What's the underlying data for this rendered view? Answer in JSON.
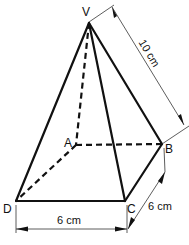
{
  "figure": {
    "type": "square-based pyramid",
    "vertices": {
      "V": {
        "label": "V",
        "x": 89,
        "y": 23
      },
      "A": {
        "label": "A",
        "x": 76,
        "y": 145
      },
      "B": {
        "label": "B",
        "x": 162,
        "y": 144
      },
      "C": {
        "label": "C",
        "x": 125,
        "y": 201
      },
      "D": {
        "label": "D",
        "x": 16,
        "y": 201
      }
    },
    "visible_edges": [
      "VD",
      "VC",
      "VB",
      "DC",
      "CB"
    ],
    "hidden_edges": [
      "VA",
      "AB",
      "AD"
    ]
  },
  "dimensions": {
    "slant_edge": {
      "label": "10 cm",
      "edge": "VB"
    },
    "base_front": {
      "label": "6 cm",
      "edge": "DC"
    },
    "base_side": {
      "label": "6 cm",
      "edge": "CB"
    }
  },
  "colors": {
    "line": "#111111",
    "background": "#ffffff"
  }
}
